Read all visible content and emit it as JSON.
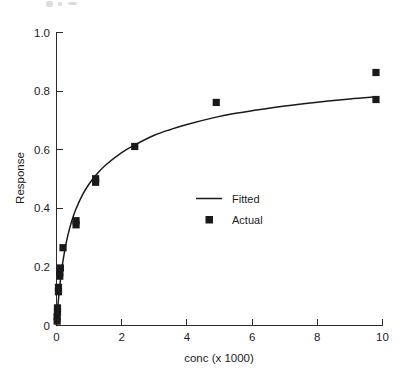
{
  "chart_data": {
    "type": "scatter",
    "title": "",
    "xlabel": "conc (x 1000)",
    "ylabel": "Response",
    "xlim": [
      0,
      10
    ],
    "ylim": [
      0,
      1.0
    ],
    "xticks": [
      "0",
      "2",
      "4",
      "6",
      "8",
      "10"
    ],
    "xtick_values": [
      0,
      2,
      4,
      6,
      8,
      10
    ],
    "yticks": [
      "0",
      "0.2",
      "0.4",
      "0.6",
      "0.8",
      "1.0"
    ],
    "ytick_values": [
      0,
      0.2,
      0.4,
      0.6,
      0.8,
      1.0
    ],
    "grid": false,
    "legend_position": "center",
    "series": [
      {
        "name": "Fitted",
        "type": "line",
        "marker": "none",
        "color": "#1a1a1a",
        "model": "Emax / Michaelis-Menten style saturation curve",
        "x": [
          0.0,
          0.05,
          0.1,
          0.15,
          0.2,
          0.3,
          0.4,
          0.5,
          0.6,
          0.8,
          1.0,
          1.2,
          1.5,
          2.0,
          2.4,
          3.0,
          3.5,
          4.0,
          4.9,
          5.5,
          6.0,
          7.0,
          8.0,
          9.0,
          9.8
        ],
        "y": [
          0.0,
          0.075,
          0.135,
          0.182,
          0.221,
          0.283,
          0.33,
          0.367,
          0.398,
          0.446,
          0.482,
          0.511,
          0.546,
          0.589,
          0.615,
          0.648,
          0.668,
          0.685,
          0.71,
          0.723,
          0.732,
          0.748,
          0.761,
          0.772,
          0.779
        ]
      },
      {
        "name": "Actual",
        "type": "scatter",
        "marker": "square",
        "color": "#1a1a1a",
        "points": [
          {
            "x": 0.02,
            "y": 0.015
          },
          {
            "x": 0.02,
            "y": 0.03
          },
          {
            "x": 0.03,
            "y": 0.045
          },
          {
            "x": 0.03,
            "y": 0.06
          },
          {
            "x": 0.06,
            "y": 0.115
          },
          {
            "x": 0.06,
            "y": 0.13
          },
          {
            "x": 0.1,
            "y": 0.168
          },
          {
            "x": 0.1,
            "y": 0.18
          },
          {
            "x": 0.12,
            "y": 0.196
          },
          {
            "x": 0.2,
            "y": 0.265
          },
          {
            "x": 0.6,
            "y": 0.343
          },
          {
            "x": 0.6,
            "y": 0.357
          },
          {
            "x": 1.2,
            "y": 0.488
          },
          {
            "x": 1.2,
            "y": 0.5
          },
          {
            "x": 2.4,
            "y": 0.61
          },
          {
            "x": 4.9,
            "y": 0.76
          },
          {
            "x": 9.8,
            "y": 0.77
          },
          {
            "x": 9.8,
            "y": 0.862
          }
        ]
      }
    ],
    "legend": [
      {
        "label": "Fitted",
        "marker": "line"
      },
      {
        "label": "Actual",
        "marker": "square"
      }
    ]
  },
  "colors": {
    "background": "#ffffff",
    "ink": "#1a1a1a",
    "axis": "#2b2b2b"
  }
}
